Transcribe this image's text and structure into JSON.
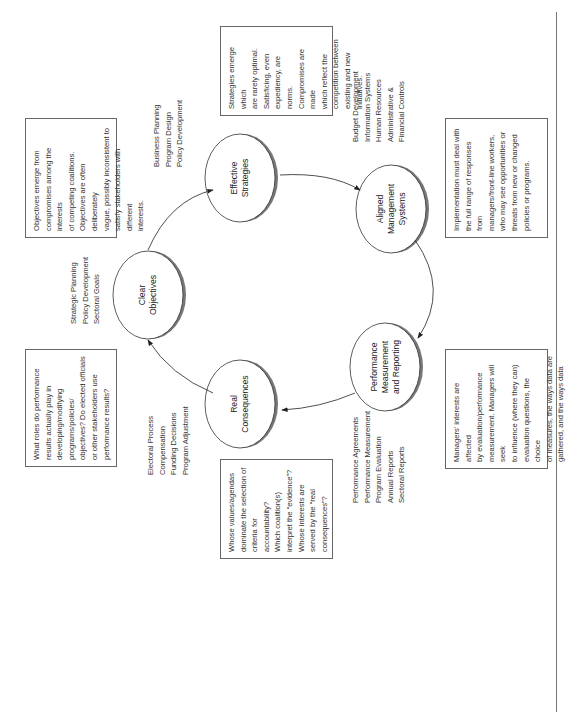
{
  "diagram": {
    "orientation": "rotated -90deg",
    "nodes": [
      {
        "id": "clear-objectives",
        "label": "Clear\nObjectives",
        "cx": 148,
        "cy": 295
      },
      {
        "id": "effective-strategies",
        "label": "Effective\nStrategies",
        "cx": 240,
        "cy": 178
      },
      {
        "id": "aligned-management-systems",
        "label": "Aligned\nManagement\nSystems",
        "cx": 391,
        "cy": 209
      },
      {
        "id": "performance-measurement",
        "label": "Performance\nMeasurement\nand Reporting",
        "cx": 385,
        "cy": 367
      },
      {
        "id": "real-consequences",
        "label": "Real\nConsequences",
        "cx": 240,
        "cy": 404
      }
    ],
    "node_lists": {
      "clear_objectives": "Strategic Planning\nPolicy Development\nSectoral Goals",
      "effective_strategies": "Business Planning\nProgram Design\nPolicy Development",
      "aligned_management": "Budget Development\nInformation Systems\nHuman Resources\nAdministrative &\nFinancial Controls",
      "performance_measurement": "Performance Agreements\nPerformance Measurement\nProgram Evaluation\nAnnual Reports\nSectoral Reports",
      "real_consequences": "Electoral Process\nCompensation\nFunding Decisions\nProgram Adjustment"
    },
    "notes": {
      "objectives": "Objectives emerge from\ncompromises among the interests\nof competing coalitions.\nObjectives are often deliberately\nvague, possibly inconsistent to\nsatisfy stakeholders with different\ninterests.",
      "strategies": "Strategies emerge which\nare rarely optimal.\nSatisficing, even\nexpediency, are norms.\nCompromises are made\nwhich reflect the\ncompetition between\nexisting and new\ninitiatives.",
      "implementation": "Implementation must deal with\nthe full range of responses from\nmanagers/front-line workers,\nwho may see opportunities or\nthreats from new or changed\npolicies or programs.",
      "managers": "Managers' interests are affected\nby evaluation/performance\nmeasurement. Managers will seek\nto influence (where they can)\nevaluation questions, the choice\nof measures, the ways data are\ngathered, and the ways data are\ninterpreted/reported.",
      "values": "Whose values/agendas\ndominate the selection of\ncriteria for accountability?\nWhich coalition(s)\ninterpret the “evidence”?\nWhose interests are\nserved by the “real\nconsequences”?",
      "roles": "What roles do performance\nresults actually play in\ndeveloping/modifying\nprograms/policies/\nobjectives? Do elected officials\nor other stakeholders use\nperformance results?"
    },
    "colors": {
      "outline": "#333333",
      "shadow": "#777777",
      "box_border": "#666666",
      "text": "#222222"
    }
  }
}
